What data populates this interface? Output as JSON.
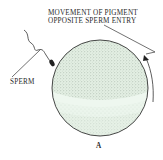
{
  "figure": {
    "labels": {
      "pigment_line1": "MOVEMENT OF PIGMENT",
      "pigment_line2": "OPPOSITE SPERM ENTRY",
      "sperm": "SPERM",
      "panel": "A"
    },
    "colors": {
      "egg_fill": "#e6f2e6",
      "egg_dark_stipple": "#b9c7bb",
      "outline": "#333333",
      "text": "#2a2a2a"
    },
    "elements": {
      "egg": "fertilized-egg-sphere",
      "sperm": "sperm-with-tail",
      "arrow": "curved-arrow-pigment-movement"
    }
  }
}
